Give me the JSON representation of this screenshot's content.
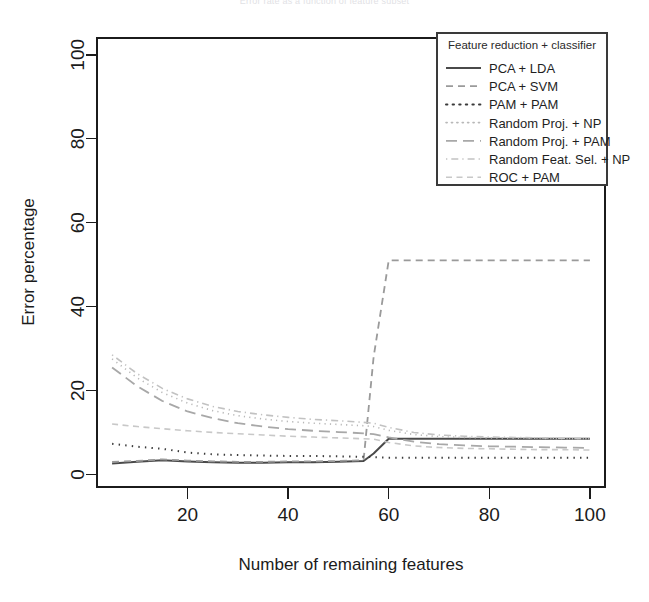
{
  "figure": {
    "cropped_title": "Error rate as a function of feature subset",
    "background_color": "#ffffff"
  },
  "chart_data": {
    "type": "line",
    "title": "",
    "xlabel": "Number of remaining features",
    "ylabel": "Error percentage",
    "xlim": [
      2,
      103
    ],
    "ylim": [
      -3,
      104
    ],
    "xticks": [
      20,
      40,
      60,
      80,
      100
    ],
    "yticks": [
      0,
      20,
      40,
      60,
      80,
      100
    ],
    "xtick_labels": [
      "20",
      "40",
      "60",
      "80",
      "100"
    ],
    "ytick_labels": [
      "0",
      "20",
      "40",
      "60",
      "80",
      "100"
    ],
    "grid": false,
    "legend_position": "top-right",
    "legend_title": "Feature reduction + classifier",
    "x": [
      5,
      10,
      15,
      20,
      25,
      30,
      35,
      40,
      45,
      50,
      55,
      57,
      60,
      65,
      70,
      75,
      80,
      85,
      90,
      95,
      100
    ],
    "series": [
      {
        "name": "PCA + LDA",
        "dash": "solid",
        "color": "#4a4a4a",
        "width": 2.0,
        "values": [
          2.6,
          3.0,
          3.4,
          3.1,
          2.9,
          2.8,
          2.8,
          2.9,
          2.9,
          3.0,
          3.2,
          5.0,
          8.5,
          8.5,
          8.5,
          8.5,
          8.5,
          8.5,
          8.5,
          8.5,
          8.5
        ]
      },
      {
        "name": "PCA + SVM",
        "dash": "dashed",
        "color": "#9a9a9a",
        "width": 1.8,
        "values": [
          3.0,
          3.2,
          3.6,
          3.3,
          3.1,
          3.0,
          3.0,
          3.1,
          3.1,
          3.2,
          3.4,
          28.0,
          51.0,
          51.0,
          51.0,
          51.0,
          51.0,
          51.0,
          51.0,
          51.0,
          51.0
        ]
      },
      {
        "name": "PAM + PAM",
        "dash": "dotted",
        "color": "#3a3a3a",
        "width": 2.0,
        "values": [
          7.3,
          6.6,
          6.1,
          5.2,
          4.8,
          4.6,
          4.5,
          4.4,
          4.4,
          4.3,
          4.2,
          4.1,
          4.0,
          4.0,
          4.0,
          4.0,
          4.0,
          4.0,
          4.0,
          4.0,
          4.0
        ]
      },
      {
        "name": "Random Proj. + NP",
        "dash": "dotted-fine",
        "color": "#b8b8b8",
        "width": 1.6,
        "values": [
          27.5,
          23.0,
          19.5,
          17.0,
          15.2,
          14.0,
          13.2,
          12.6,
          12.2,
          11.9,
          11.6,
          11.4,
          10.5,
          9.5,
          9.0,
          8.8,
          8.7,
          8.6,
          8.6,
          8.5,
          8.5
        ]
      },
      {
        "name": "Random Proj. + PAM",
        "dash": "longdash",
        "color": "#a8a8a8",
        "width": 1.8,
        "values": [
          25.5,
          21.0,
          17.5,
          15.0,
          13.4,
          12.2,
          11.4,
          10.8,
          10.4,
          10.1,
          9.8,
          9.6,
          8.8,
          7.8,
          7.2,
          6.9,
          6.7,
          6.6,
          6.5,
          6.4,
          6.3
        ]
      },
      {
        "name": "Random Feat. Sel. + NP",
        "dash": "dotdash",
        "color": "#c2c2c2",
        "width": 1.6,
        "values": [
          28.5,
          24.0,
          20.5,
          18.0,
          16.2,
          15.0,
          14.2,
          13.6,
          13.1,
          12.8,
          12.4,
          12.2,
          11.2,
          10.0,
          9.4,
          9.1,
          8.9,
          8.8,
          8.7,
          8.6,
          8.5
        ]
      },
      {
        "name": "ROC + PAM",
        "dash": "dashdot-light",
        "color": "#c8c8c8",
        "width": 1.6,
        "values": [
          12.0,
          11.4,
          10.9,
          10.4,
          10.0,
          9.7,
          9.4,
          9.1,
          8.9,
          8.7,
          8.5,
          8.4,
          7.6,
          6.8,
          6.4,
          6.2,
          6.1,
          6.0,
          5.9,
          5.9,
          5.8
        ]
      }
    ]
  }
}
